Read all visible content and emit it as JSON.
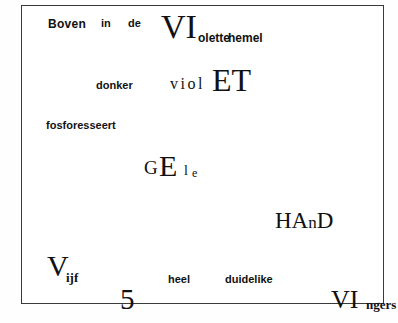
{
  "page": {
    "kind": "concrete-poem-scan",
    "language": "Dutch",
    "background_color": "#fefefe",
    "ink_color": "#111111",
    "frame_color": "#3a3a3a"
  },
  "poem": {
    "lines": [
      {
        "id": "line-1",
        "words": [
          "Boven",
          "in",
          "de",
          "VI",
          "olette",
          "hemel"
        ],
        "reading": "Boven in de VIolette hemel"
      },
      {
        "id": "line-2",
        "words": [
          "donker",
          "viol",
          "ET"
        ],
        "reading": "donker violET"
      },
      {
        "id": "line-3",
        "words": [
          "fosforesseert"
        ],
        "reading": "fosforesseert"
      },
      {
        "id": "line-4",
        "words": [
          "G",
          "E",
          "l",
          "e"
        ],
        "reading": "GEle"
      },
      {
        "id": "line-5",
        "words": [
          "HA",
          "n",
          "D"
        ],
        "reading": "HAnD"
      },
      {
        "id": "line-6",
        "words": [
          "V",
          "ijf",
          "heel",
          "duidelike"
        ],
        "reading": "Vijf heel duidelike"
      },
      {
        "id": "line-7",
        "words": [
          "5",
          "VI",
          "ngers"
        ],
        "reading": "5 VIngers"
      }
    ],
    "tokens": {
      "boven": "Boven",
      "in": "in",
      "de": "de",
      "vi_caps": "VI",
      "olette": "olette",
      "hemel": "hemel",
      "donker": "donker",
      "viol": "viol",
      "et_caps": "ET",
      "fosforesseert": "fosforesseert",
      "g_cap": "G",
      "e_cap": "E",
      "l_small": "l",
      "e_small": "e",
      "hand_ha": "HA",
      "hand_n": "n",
      "hand_d": "D",
      "v_cap": "V",
      "ijf": "ijf",
      "heel": "heel",
      "duidelike": "duidelike",
      "five": "5",
      "vi_caps2": "VI",
      "ngers": "ngers"
    }
  }
}
